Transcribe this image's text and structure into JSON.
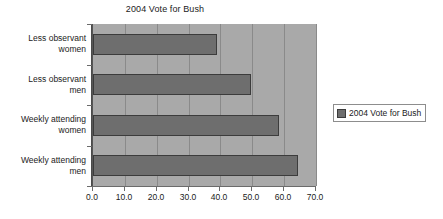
{
  "chart_data": {
    "type": "bar",
    "orientation": "horizontal",
    "title": "2004 Vote for Bush",
    "xlabel": "",
    "ylabel": "",
    "xlim": [
      0,
      70
    ],
    "grid": true,
    "legend_position": "right",
    "categories": [
      "Less observant women",
      "Less observant men",
      "Weekly attending women",
      "Weekly attending men"
    ],
    "category_lines": [
      [
        "Less observant",
        "women"
      ],
      [
        "Less observant",
        "men"
      ],
      [
        "Weekly attending",
        "women"
      ],
      [
        "Weekly attending",
        "men"
      ]
    ],
    "series": [
      {
        "name": "2004 Vote for Bush",
        "values": [
          39.0,
          49.5,
          58.5,
          64.5
        ],
        "color": "#6e6e6e"
      }
    ],
    "xticks": [
      0,
      10,
      20,
      30,
      40,
      50,
      60,
      70
    ],
    "xtick_labels": [
      "0.0",
      "10.0",
      "20.0",
      "30.0",
      "40.0",
      "50.0",
      "60.0",
      "70.0"
    ]
  },
  "legend": {
    "entries": [
      {
        "label": "2004 Vote for Bush",
        "color": "#6e6e6e"
      }
    ]
  },
  "colors": {
    "bar_fill": "#6e6e6e",
    "bar_border": "#3c3c3c",
    "plot_background": "#a9a9a9",
    "gridline": "#8a8a8a",
    "text": "#1b1b1b"
  }
}
